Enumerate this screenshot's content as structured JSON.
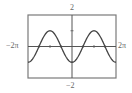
{
  "chart_data": {
    "type": "line",
    "title": "",
    "function": "y = -cos(x)",
    "xlabel": "",
    "ylabel": "",
    "xlim": [
      -6.2832,
      6.2832
    ],
    "ylim": [
      -2,
      2
    ],
    "x_tick_labels": {
      "left": "−2π",
      "right": "2π"
    },
    "y_tick_labels": {
      "top": "2",
      "bottom": "−2"
    },
    "grid": false,
    "series": [
      {
        "name": "curve",
        "x": [
          -6.2832,
          -4.7124,
          -3.1416,
          -1.5708,
          0,
          1.5708,
          3.1416,
          4.7124,
          6.2832
        ],
        "y": [
          -1,
          0,
          1,
          0,
          -1,
          0,
          1,
          0,
          -1
        ]
      }
    ]
  },
  "labels": {
    "y_max": "2",
    "y_min": "−2",
    "x_min": "−2π",
    "x_max": "2π"
  },
  "colors": {
    "frame": "#7a7a7a",
    "axis": "#555555",
    "curve": "#444444"
  }
}
